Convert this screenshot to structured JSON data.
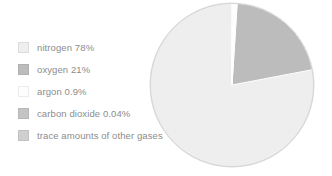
{
  "figure": {
    "background_color": "#ffffff"
  },
  "chart_data": {
    "type": "pie",
    "title": "",
    "subtitle": "",
    "xlabel": "",
    "ylabel": "",
    "grid": false,
    "legend_position": "left",
    "start_angle_deg": 0,
    "direction": "counterclockwise",
    "categories": [
      "nitrogen",
      "oxygen",
      "argon",
      "carbon dioxide",
      "trace amounts of other gases"
    ],
    "values": [
      78,
      21,
      0.9,
      0.04,
      0.06
    ],
    "value_labels": [
      "78%",
      "21%",
      "0.9%",
      "0.04%",
      ""
    ],
    "colors": [
      "#eeeeee",
      "#bcbcbc",
      "#fdfdfd",
      "#c4c4c4",
      "#cfcfcf"
    ],
    "slice_stroke": "#ffffff",
    "legend_entries": [
      "nitrogen 78%",
      "oxygen 21%",
      "argon 0.9%",
      "carbon dioxide 0.04%",
      "trace amounts of other gases"
    ]
  },
  "legend": {
    "items": [
      {
        "label": "nitrogen 78%",
        "color": "#eeeeee",
        "swatch_border": "#dcdcdc"
      },
      {
        "label": "oxygen 21%",
        "color": "#bcbcbc",
        "swatch_border": "#b0b0b0"
      },
      {
        "label": "argon 0.9%",
        "color": "#fdfdfd",
        "swatch_border": "#ececec"
      },
      {
        "label": "carbon dioxide 0.04%",
        "color": "#c4c4c4",
        "swatch_border": "#b8b8b8"
      },
      {
        "label": "trace amounts of other gases",
        "color": "#cfcfcf",
        "swatch_border": "#c2c2c2"
      }
    ],
    "text_color": "#8c8c8c"
  },
  "pie": {
    "center_x": 83,
    "center_y": 83,
    "radius": 82,
    "edge_color": "#d5d5d5"
  }
}
